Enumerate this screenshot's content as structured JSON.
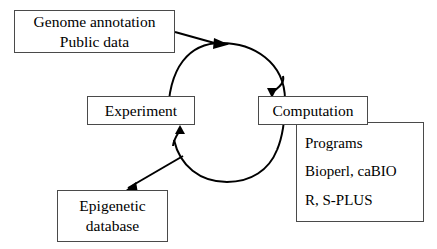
{
  "diagram": {
    "background_color": "#ffffff",
    "stroke_color": "#000000",
    "box_border_color": "#4a4a4a",
    "nodes": {
      "genome": {
        "name": "Genome annotation / Public data",
        "lines": [
          "Genome annotation",
          "Public data"
        ]
      },
      "experiment": {
        "name": "Experiment",
        "lines": [
          "Experiment"
        ]
      },
      "computation": {
        "name": "Computation",
        "lines": [
          "Computation"
        ]
      },
      "programs": {
        "name": "Programs panel",
        "lines": [
          "Programs",
          "Bioperl, caBIO",
          "R, S-PLUS"
        ]
      },
      "epigenetic_database": {
        "name": "Epigenetic database",
        "lines": [
          "Epigenetic",
          "database"
        ]
      }
    },
    "edges": [
      {
        "id": "genome-to-cycle",
        "from": "Genome annotation / Public data",
        "to": "cycle top",
        "style": "straight-arrow"
      },
      {
        "id": "cycle-top-to-computation",
        "from": "cycle top",
        "to": "Computation",
        "style": "curved-arrow"
      },
      {
        "id": "cycle-bottom-to-experiment",
        "from": "cycle bottom",
        "to": "Experiment",
        "style": "curved-arrow"
      },
      {
        "id": "cycle-to-epigenetic-database",
        "from": "cycle lower-left",
        "to": "Epigenetic database",
        "style": "straight-arrow"
      }
    ]
  }
}
